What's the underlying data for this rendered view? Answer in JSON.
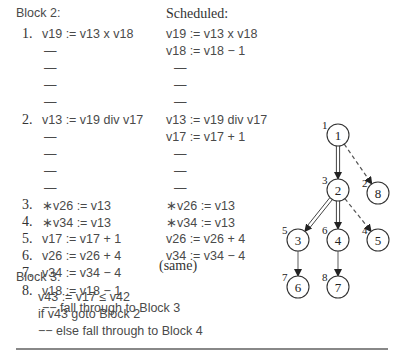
{
  "block2": {
    "heading": "Block 2:",
    "rows": [
      {
        "num": "1.",
        "code": "v19 := v13 x v18"
      },
      {
        "num": "",
        "code": "—"
      },
      {
        "num": "",
        "code": "—"
      },
      {
        "num": "",
        "code": "—"
      },
      {
        "num": "",
        "code": "—"
      },
      {
        "num": "2.",
        "code": "v13 := v19 div v17"
      },
      {
        "num": "",
        "code": "—"
      },
      {
        "num": "",
        "code": "—"
      },
      {
        "num": "",
        "code": "—"
      },
      {
        "num": "",
        "code": "—"
      },
      {
        "num": "3.",
        "code": "∗v26 := v13"
      },
      {
        "num": "4.",
        "code": "∗v34 := v13"
      },
      {
        "num": "5.",
        "code": "v17 := v17 + 1"
      },
      {
        "num": "6.",
        "code": "v26 := v26 + 4"
      },
      {
        "num": "7.",
        "code": "v34 := v34 − 4"
      },
      {
        "num": "8.",
        "code": "v18 := v18 − 1"
      },
      {
        "num": "",
        "code": "−− fall through to Block 3"
      }
    ]
  },
  "scheduled": {
    "heading": "Scheduled:",
    "rows": [
      "v19 := v13 x v18",
      "v18 := v18 − 1",
      "—",
      "—",
      "—",
      "v13 := v19 div v17",
      "v17 := v17 + 1",
      "—",
      "—",
      "—",
      "∗v26 := v13",
      "∗v34 := v13",
      "v26 := v26 + 4",
      "v34 := v34 − 4"
    ],
    "same_label": "(same)"
  },
  "block3": {
    "heading": "Block 3:",
    "rows": [
      "v43 := v17 ≤ v42",
      "if v43 goto Block 2",
      "−− else fall through to Block 4"
    ]
  },
  "graph": {
    "nodes": [
      {
        "id": "1",
        "label": "1",
        "priority": "1",
        "x": 338,
        "y": 135
      },
      {
        "id": "2",
        "label": "2",
        "priority": "3",
        "x": 338,
        "y": 190
      },
      {
        "id": "8",
        "label": "8",
        "priority": "2",
        "x": 378,
        "y": 193
      },
      {
        "id": "3",
        "label": "3",
        "priority": "5",
        "x": 298,
        "y": 240
      },
      {
        "id": "4",
        "label": "4",
        "priority": "6",
        "x": 338,
        "y": 240
      },
      {
        "id": "5",
        "label": "5",
        "priority": "4",
        "x": 378,
        "y": 240
      },
      {
        "id": "6",
        "label": "6",
        "priority": "7",
        "x": 298,
        "y": 287
      },
      {
        "id": "7",
        "label": "7",
        "priority": "8",
        "x": 338,
        "y": 287
      }
    ],
    "edges": [
      {
        "from": "1",
        "to": "2",
        "style": "double"
      },
      {
        "from": "1",
        "to": "8",
        "style": "dashed"
      },
      {
        "from": "2",
        "to": "3",
        "style": "double"
      },
      {
        "from": "2",
        "to": "4",
        "style": "double"
      },
      {
        "from": "2",
        "to": "5",
        "style": "dashed"
      },
      {
        "from": "3",
        "to": "6",
        "style": "solid"
      },
      {
        "from": "4",
        "to": "7",
        "style": "solid"
      }
    ]
  }
}
